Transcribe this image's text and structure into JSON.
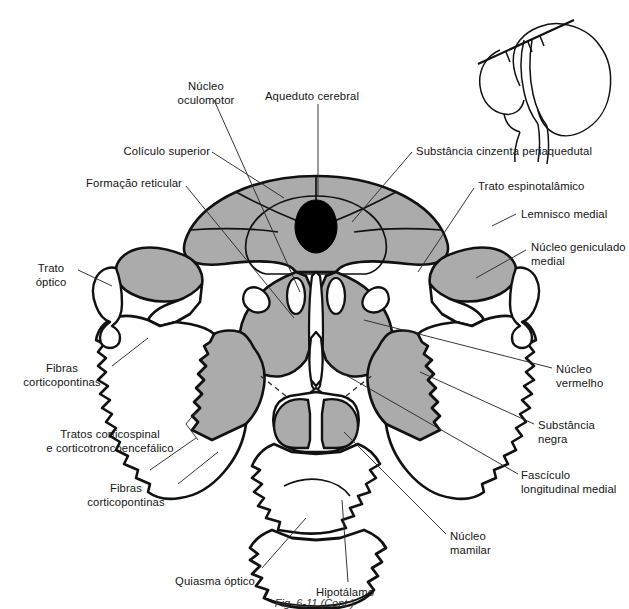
{
  "figure": {
    "kind": "anatomical-diagram",
    "language": "pt-BR",
    "caption": "Fig. 6-11 (Cont.)",
    "background_color": "#ffffff",
    "outline_color": "#111111",
    "gray_fill_color": "#ababab",
    "black_fill_color": "#000000",
    "leader_color": "#2b2b2b"
  },
  "inset": {
    "name": "brain-orientation-inset",
    "description": "Contorno do encéfalo em vista medial com linha do plano de corte",
    "plane_line_label": ""
  },
  "labels": [
    {
      "id": "nucleo-oculomotor",
      "text": "Núcleo\noculomotor",
      "align": "center",
      "x": 161,
      "y": 80,
      "w": 90
    },
    {
      "id": "aqueduto-cerebral",
      "text": "Aqueduto cerebral",
      "align": "center",
      "x": 252,
      "y": 90,
      "w": 120
    },
    {
      "id": "substancia-cinzenta-periaquedutal",
      "text": "Substância cinzenta periaquedutal",
      "align": "left",
      "x": 416,
      "y": 145,
      "w": 200
    },
    {
      "id": "colico-superior",
      "text": "Colículo superior",
      "align": "right",
      "x": 100,
      "y": 145,
      "w": 110
    },
    {
      "id": "formacao-reticular",
      "text": "Formação reticular",
      "align": "right",
      "x": 57,
      "y": 177,
      "w": 125
    },
    {
      "id": "trato-espinotalamico",
      "text": "Trato espinotalâmico",
      "align": "left",
      "x": 478,
      "y": 180,
      "w": 135
    },
    {
      "id": "lemnisco-medial",
      "text": "Lemnisco medial",
      "align": "left",
      "x": 521,
      "y": 208,
      "w": 110
    },
    {
      "id": "nucleo-geniculado-medial",
      "text": "Núcleo geniculado\nmedial",
      "align": "left",
      "x": 531,
      "y": 241,
      "w": 105
    },
    {
      "id": "trato-optico",
      "text": "Trato\nóptico",
      "align": "center",
      "x": 25,
      "y": 262,
      "w": 52
    },
    {
      "id": "fibras-corticopontinas-sup",
      "text": "Fibras\ncorticopontinas",
      "align": "center",
      "x": 62,
      "y": 368,
      "w": 100
    },
    {
      "id": "tratos-corticospinal",
      "text": "Tratos corticospinal\ne corticotroncoencefálico",
      "align": "center",
      "x": 26,
      "y": 432,
      "w": 170
    },
    {
      "id": "fibras-corticopontinas-inf",
      "text": "Fibras\ncorticopontinas",
      "align": "center",
      "x": 128,
      "y": 486,
      "w": 100
    },
    {
      "id": "nucleo-vermelho",
      "text": "Núcleo\nvermelho",
      "align": "left",
      "x": 556,
      "y": 363,
      "w": 70
    },
    {
      "id": "substancia-negra",
      "text": "Substância\nnegra",
      "align": "left",
      "x": 538,
      "y": 419,
      "w": 84
    },
    {
      "id": "fasciculo-longitudinal-medial",
      "text": "Fascículo\nlongitudinal medial",
      "align": "left",
      "x": 521,
      "y": 469,
      "w": 108
    },
    {
      "id": "nucleo-mamilar",
      "text": "Núcleo\nmamilar",
      "align": "left",
      "x": 450,
      "y": 530,
      "w": 70
    },
    {
      "id": "quiasma-optico",
      "text": "Quiasma óptico",
      "align": "center",
      "x": 215,
      "y": 575,
      "w": 106
    },
    {
      "id": "hipotalamo",
      "text": "Hipotálamo",
      "align": "center",
      "x": 345,
      "y": 588,
      "w": 74
    }
  ],
  "structures": [
    {
      "id": "colico-superior-region",
      "name": "Colículo superior",
      "fill": "gray"
    },
    {
      "id": "periaqueductal-gray",
      "name": "Substância cinzenta periaquedutal",
      "fill": "gray"
    },
    {
      "id": "cerebral-aqueduct",
      "name": "Aqueduto cerebral",
      "fill": "black"
    },
    {
      "id": "red-nucleus-left",
      "name": "Núcleo vermelho (esq.)",
      "fill": "gray"
    },
    {
      "id": "red-nucleus-right",
      "name": "Núcleo vermelho (dir.)",
      "fill": "gray"
    },
    {
      "id": "substantia-nigra-left",
      "name": "Substância negra (esq.)",
      "fill": "gray"
    },
    {
      "id": "substantia-nigra-right",
      "name": "Substância negra (dir.)",
      "fill": "gray"
    },
    {
      "id": "medial-geniculate-left",
      "name": "Núcleo geniculado medial (esq.)",
      "fill": "gray"
    },
    {
      "id": "medial-geniculate-right",
      "name": "Núcleo geniculado medial (dir.)",
      "fill": "gray"
    },
    {
      "id": "mammillary-body-left",
      "name": "Corpo mamilar (esq.)",
      "fill": "gray"
    },
    {
      "id": "mammillary-body-right",
      "name": "Corpo mamilar (dir.)",
      "fill": "gray"
    },
    {
      "id": "optic-chiasm",
      "name": "Quiasma óptico",
      "fill": "white"
    },
    {
      "id": "hypothalamus",
      "name": "Hipotálamo",
      "fill": "white"
    },
    {
      "id": "optic-tract-left",
      "name": "Trato óptico (esq.)",
      "fill": "white"
    },
    {
      "id": "corticopontine-left",
      "name": "Fibras corticopontinas (esq.)",
      "fill": "white"
    },
    {
      "id": "corticospinal-left",
      "name": "Tratos corticospinal (esq.)",
      "fill": "white"
    }
  ]
}
